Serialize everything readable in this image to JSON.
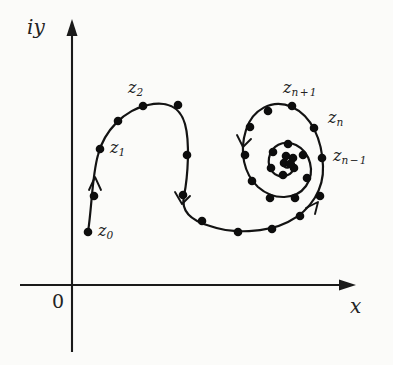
{
  "figure": {
    "kind": "complex-plane-sequence-spiral",
    "background_color": "#fbfbf9",
    "ink_color": "#131313"
  },
  "axes": {
    "y_label": "iy",
    "x_label": "x",
    "origin_label": "0",
    "y_axis": {
      "x": 72,
      "top": 22,
      "bottom": 352
    },
    "x_axis": {
      "y": 285,
      "left": 20,
      "right": 352
    }
  },
  "labels": {
    "z0": {
      "base": "z",
      "sub": "0"
    },
    "z1": {
      "base": "z",
      "sub": "1"
    },
    "z2": {
      "base": "z",
      "sub": "2"
    },
    "zn_plus_1": {
      "base": "z",
      "sub": "n",
      "op": "+",
      "op_sub": "1"
    },
    "zn": {
      "base": "z",
      "sub": "n"
    },
    "zn_minus_1": {
      "base": "z",
      "sub": "n",
      "op": "−",
      "op_sub": "1"
    }
  },
  "chart_data": {
    "type": "scatter",
    "title": "",
    "xlabel": "x",
    "ylabel": "iy",
    "grid": false,
    "legend": false,
    "origin_px": {
      "x": 72,
      "y": 285
    },
    "points_px": [
      {
        "name": "z0",
        "x": 88,
        "y": 232
      },
      {
        "name": "",
        "x": 94,
        "y": 196
      },
      {
        "name": "z1",
        "x": 100,
        "y": 149
      },
      {
        "name": "",
        "x": 118,
        "y": 121
      },
      {
        "name": "z2",
        "x": 143,
        "y": 106
      },
      {
        "name": "",
        "x": 178,
        "y": 105
      },
      {
        "name": "",
        "x": 187,
        "y": 155
      },
      {
        "name": "",
        "x": 183,
        "y": 195
      },
      {
        "name": "",
        "x": 202,
        "y": 221
      },
      {
        "name": "",
        "x": 238,
        "y": 232
      },
      {
        "name": "",
        "x": 272,
        "y": 229
      },
      {
        "name": "",
        "x": 300,
        "y": 216
      },
      {
        "name": "",
        "x": 320,
        "y": 196
      },
      {
        "name": "zn_minus_1",
        "x": 322,
        "y": 158
      },
      {
        "name": "zn",
        "x": 314,
        "y": 128
      },
      {
        "name": "zn_plus_1",
        "x": 292,
        "y": 106
      },
      {
        "name": "",
        "x": 268,
        "y": 111
      },
      {
        "name": "",
        "x": 250,
        "y": 127
      },
      {
        "name": "",
        "x": 245,
        "y": 155
      },
      {
        "name": "",
        "x": 252,
        "y": 181
      },
      {
        "name": "",
        "x": 270,
        "y": 198
      },
      {
        "name": "",
        "x": 295,
        "y": 198
      },
      {
        "name": "",
        "x": 307,
        "y": 178
      },
      {
        "name": "",
        "x": 303,
        "y": 155
      },
      {
        "name": "",
        "x": 288,
        "y": 144
      },
      {
        "name": "",
        "x": 273,
        "y": 152
      },
      {
        "name": "",
        "x": 271,
        "y": 168
      },
      {
        "name": "",
        "x": 283,
        "y": 175
      },
      {
        "name": "",
        "x": 294,
        "y": 168
      },
      {
        "name": "",
        "x": 293,
        "y": 158
      },
      {
        "name": "",
        "x": 286,
        "y": 156
      },
      {
        "name": "",
        "x": 284,
        "y": 163
      },
      {
        "name": "",
        "x": 290,
        "y": 164
      }
    ],
    "direction_arrows_px": [
      {
        "x": 95,
        "y": 178,
        "angle": -80
      },
      {
        "x": 182,
        "y": 203,
        "angle": 72
      },
      {
        "x": 243,
        "y": 146,
        "angle": 100
      },
      {
        "x": 317,
        "y": 203,
        "angle": -58
      }
    ]
  }
}
